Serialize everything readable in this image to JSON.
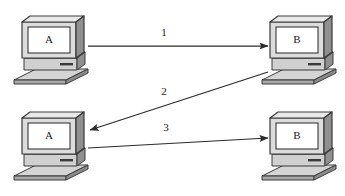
{
  "diagram": {
    "type": "protocol-message-sequence",
    "background_color": "#ffffff",
    "line_color": "#2b2b2b",
    "nodes": [
      {
        "id": "node-a-top",
        "label": "A",
        "role": "computer",
        "position": "top-left"
      },
      {
        "id": "node-b-top",
        "label": "B",
        "role": "computer",
        "position": "top-right"
      },
      {
        "id": "node-a-bottom",
        "label": "A",
        "role": "computer",
        "position": "bottom-left"
      },
      {
        "id": "node-b-bottom",
        "label": "B",
        "role": "computer",
        "position": "bottom-right"
      }
    ],
    "messages": [
      {
        "id": "message-1",
        "label": "1",
        "from": "A",
        "to": "B",
        "direction": "left-to-right",
        "style": "horizontal"
      },
      {
        "id": "message-2",
        "label": "2",
        "from": "B",
        "to": "A",
        "direction": "right-to-left",
        "style": "diagonal"
      },
      {
        "id": "message-3",
        "label": "3",
        "from": "A",
        "to": "B",
        "direction": "left-to-right",
        "style": "near-horizontal"
      }
    ],
    "colors": {
      "case_light": "#e8e8e8",
      "case_mid": "#c9c9c9",
      "case_dark": "#9a9a9a",
      "case_darker": "#7d7d7d",
      "screen": "#ffffff",
      "outline": "#3a3a3a"
    }
  }
}
